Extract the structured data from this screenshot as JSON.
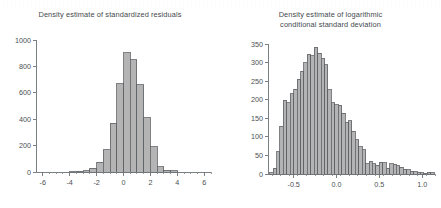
{
  "figure": {
    "background": "#ffffff",
    "bar_fill": "#b4b4b4",
    "bar_edge": "#5f6265",
    "axis_color": "#6d7275",
    "text_color": "#44494c"
  },
  "chart_data": [
    {
      "type": "bar",
      "id": "standardized-residuals",
      "title": "Density estimate of standardized residuals",
      "xlabel": "",
      "ylabel": "",
      "grid": false,
      "legend": "none",
      "xlim": [
        -6.5,
        6.5
      ],
      "ylim": [
        0,
        1000
      ],
      "xticks": [
        -6,
        -4,
        -2,
        0,
        2,
        4,
        6
      ],
      "xtick_labels": [
        "-6",
        "-4",
        "-2",
        "0",
        "2",
        "4",
        "6"
      ],
      "minor_xticks": [
        -5.5,
        -5,
        -4.5,
        -3.5,
        -3,
        -2.5,
        -1.5,
        -1,
        -0.5,
        0.5,
        1,
        1.5,
        2.5,
        3,
        3.5,
        4.5,
        5,
        5.5,
        6.5
      ],
      "yticks": [
        0,
        200,
        400,
        600,
        800,
        1000
      ],
      "ytick_labels": [
        "0",
        "200",
        "400",
        "600",
        "800",
        "1000"
      ],
      "bin_width": 0.5,
      "bin_starts": [
        -4.0,
        -3.5,
        -3.0,
        -2.5,
        -2.0,
        -1.5,
        -1.0,
        -0.5,
        0.0,
        0.5,
        1.0,
        1.5,
        2.0,
        2.5,
        3.0,
        3.5
      ],
      "values": [
        3,
        5,
        10,
        30,
        75,
        170,
        370,
        670,
        905,
        850,
        660,
        410,
        190,
        40,
        15,
        8
      ],
      "categories": [
        "-4.0",
        "-3.5",
        "-3.0",
        "-2.5",
        "-2.0",
        "-1.5",
        "-1.0",
        "-0.5",
        "0.0",
        "0.5",
        "1.0",
        "1.5",
        "2.0",
        "2.5",
        "3.0",
        "3.5"
      ]
    },
    {
      "type": "bar",
      "id": "log-conditional-standard-deviation",
      "title": "Density estimate of logarithmic\nconditional standard deviation",
      "xlabel": "",
      "ylabel": "",
      "grid": false,
      "legend": "none",
      "xlim": [
        -0.8,
        1.15
      ],
      "ylim": [
        0,
        350
      ],
      "xticks": [
        -0.5,
        0.0,
        0.5,
        1.0
      ],
      "xtick_labels": [
        "-0.5",
        "0.0",
        "0.5",
        "1.0"
      ],
      "minor_xticks": [
        -0.75,
        -0.65,
        -0.55,
        -0.45,
        -0.35,
        -0.25,
        -0.15,
        -0.05,
        0.05,
        0.15,
        0.25,
        0.35,
        0.45,
        0.55,
        0.65,
        0.75,
        0.85,
        0.95,
        1.05,
        1.15
      ],
      "yticks": [
        0,
        50,
        100,
        150,
        200,
        250,
        300,
        350
      ],
      "ytick_labels": [
        "0",
        "50",
        "100",
        "150",
        "200",
        "250",
        "300",
        "350"
      ],
      "bin_width": 0.04,
      "bin_starts": [
        -0.78,
        -0.74,
        -0.7,
        -0.66,
        -0.62,
        -0.58,
        -0.54,
        -0.5,
        -0.46,
        -0.42,
        -0.38,
        -0.34,
        -0.3,
        -0.26,
        -0.22,
        -0.18,
        -0.14,
        -0.1,
        -0.06,
        -0.02,
        0.02,
        0.06,
        0.1,
        0.14,
        0.18,
        0.22,
        0.26,
        0.3,
        0.34,
        0.38,
        0.42,
        0.46,
        0.5,
        0.54,
        0.58,
        0.62,
        0.66,
        0.7,
        0.74,
        0.78,
        0.82,
        0.86,
        0.9,
        0.94,
        0.98,
        1.02,
        1.06,
        1.1
      ],
      "values": [
        4,
        15,
        60,
        128,
        198,
        192,
        216,
        228,
        255,
        277,
        300,
        323,
        318,
        341,
        325,
        312,
        294,
        227,
        192,
        186,
        185,
        164,
        140,
        143,
        115,
        92,
        74,
        65,
        28,
        35,
        27,
        24,
        31,
        30,
        16,
        27,
        26,
        22,
        18,
        13,
        12,
        8,
        6,
        5,
        3,
        2,
        5,
        3
      ],
      "categories": [
        "-0.78",
        "-0.74",
        "-0.70",
        "-0.66",
        "-0.62",
        "-0.58",
        "-0.54",
        "-0.50",
        "-0.46",
        "-0.42",
        "-0.38",
        "-0.34",
        "-0.30",
        "-0.26",
        "-0.22",
        "-0.18",
        "-0.14",
        "-0.10",
        "-0.06",
        "-0.02",
        "0.02",
        "0.06",
        "0.10",
        "0.14",
        "0.18",
        "0.22",
        "0.26",
        "0.30",
        "0.34",
        "0.38",
        "0.42",
        "0.46",
        "0.50",
        "0.54",
        "0.58",
        "0.62",
        "0.66",
        "0.70",
        "0.74",
        "0.78",
        "0.82",
        "0.86",
        "0.90",
        "0.94",
        "0.98",
        "1.02",
        "1.06",
        "1.10"
      ]
    }
  ]
}
